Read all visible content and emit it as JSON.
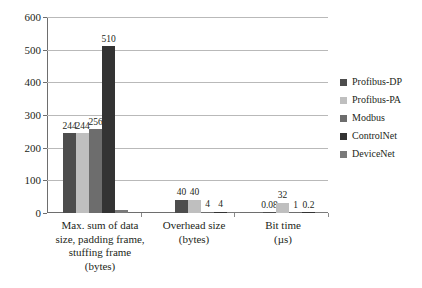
{
  "chart_data": {
    "type": "bar",
    "title": "",
    "xlabel": "",
    "ylabel": "",
    "ylim": [
      0,
      600
    ],
    "yticks": [
      "0",
      "100",
      "200",
      "300",
      "400",
      "500",
      "600"
    ],
    "grid": true,
    "legend_position": "right",
    "categories": [
      "Max. sum of data size, padding frame, stuffing frame (bytes)",
      "Overhead size (bytes)",
      "Bit time (µs)"
    ],
    "category_lines": [
      [
        "Max. sum of data",
        "size, padding frame,",
        "stuffing frame",
        "(bytes)"
      ],
      [
        "Overhead size",
        "(bytes)"
      ],
      [
        "Bit time",
        "(µs)"
      ]
    ],
    "series": [
      {
        "name": "Profibus-DP",
        "color": "#4d4d4d",
        "values": [
          244,
          40,
          0.08
        ],
        "labels": [
          "244",
          "40",
          "0.08"
        ]
      },
      {
        "name": "Profibus-PA",
        "color": "#bfbfbf",
        "values": [
          244,
          40,
          32
        ],
        "labels": [
          "244",
          "40",
          "32"
        ]
      },
      {
        "name": "Modbus",
        "color": "#6d6d6d",
        "values": [
          256,
          4,
          1
        ],
        "labels": [
          "256",
          "4",
          "1"
        ]
      },
      {
        "name": "ControlNet",
        "color": "#333333",
        "values": [
          510,
          4,
          0.2
        ],
        "labels": [
          "510",
          "4",
          "0.2"
        ]
      },
      {
        "name": "DeviceNet",
        "color": "#7a7a7a",
        "values": [
          8,
          2,
          0
        ],
        "labels": [
          "",
          "",
          ""
        ]
      }
    ]
  }
}
